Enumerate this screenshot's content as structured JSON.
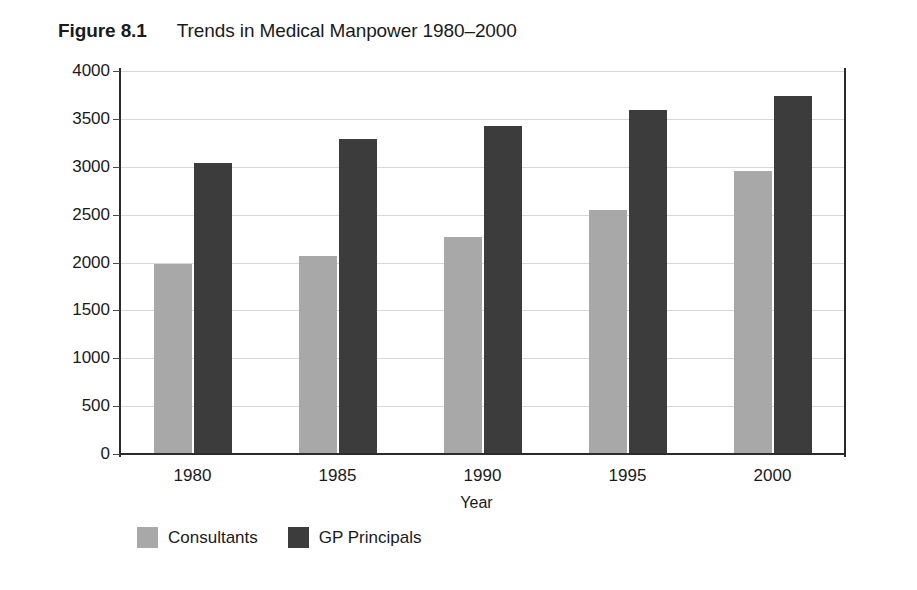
{
  "figure": {
    "label": "Figure 8.1",
    "caption": "Trends in Medical Manpower 1980–2000"
  },
  "chart_data": {
    "type": "bar",
    "title": "Trends in Medical Manpower 1980–2000",
    "subtitle": "",
    "xlabel": "Year",
    "ylabel": "Number",
    "categories": [
      "1980",
      "1985",
      "1990",
      "1995",
      "2000"
    ],
    "series": [
      {
        "name": "Consultants",
        "color": "#a8a8a8",
        "values": [
          1985,
          2070,
          2270,
          2550,
          2960
        ]
      },
      {
        "name": "GP Principals",
        "color": "#3c3c3c",
        "values": [
          3040,
          3290,
          3425,
          3595,
          3740
        ]
      }
    ],
    "ylim": [
      0,
      4000
    ],
    "yticks": [
      0,
      500,
      1000,
      1500,
      2000,
      2500,
      3000,
      3500,
      4000
    ],
    "ytick_labels": [
      "0",
      "500",
      "1000",
      "1500",
      "2000",
      "2500",
      "3000",
      "3500",
      "4000"
    ],
    "grid": true,
    "grid_axis": "y",
    "legend_position": "below-left",
    "bar_group_gap": true
  },
  "legend": {
    "items": [
      {
        "label": "Consultants",
        "color": "#a8a8a8"
      },
      {
        "label": "GP Principals",
        "color": "#3c3c3c"
      }
    ]
  },
  "colors": {
    "consultants": "#a8a8a8",
    "gp_principals": "#3c3c3c",
    "axis": "#2b2b2b",
    "gridline": "#d7d7d7",
    "text": "#1a1a1a",
    "background": "#ffffff"
  }
}
